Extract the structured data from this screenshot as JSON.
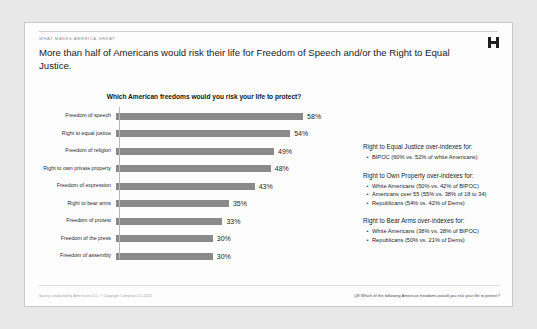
{
  "slide": {
    "eyebrow": "WHAT MAKES AMERICA GREAT",
    "title": "More than half of Americans would risk their life for Freedom of Speech and/or the Right to Equal Justice.",
    "logo_icon": "brand-mark-icon"
  },
  "footer": {
    "source": "Survey conducted by Americans LLC. © Copyright Company LLC 2021",
    "question": "Q8 Which of the following American freedoms would you risk your life to protect?"
  },
  "notes": [
    {
      "heading": "Right to Equal Justice over-indexes for:",
      "items": [
        "BIPOC (60% vs. 52% of white Americans)"
      ]
    },
    {
      "heading": "Right to Own Property over-indexes for:",
      "items": [
        "White Americans (50% vs. 42% of BIPOC)",
        "Americans over 55 (55% vs. 38% of 18 to 34)",
        "Republicans (54% vs. 42% of Dems)"
      ]
    },
    {
      "heading": "Right to Bear Arms over-indexes for:",
      "items": [
        "White Americans (38% vs. 28% of BIPOC)",
        "Republicans (50% vs. 21% of Dems)"
      ]
    }
  ],
  "chart_data": {
    "type": "bar",
    "orientation": "horizontal",
    "title": "Which American freedoms would you risk your life to protect?",
    "xlabel": "",
    "ylabel": "",
    "xlim": [
      0,
      62
    ],
    "grid": false,
    "legend": "none",
    "bar_color": "#8a8a8a",
    "categories": [
      "Freedom of speech",
      "Right to equal justice",
      "Freedom of religion",
      "Right to own private property",
      "Freedom of expression",
      "Right to bear arms",
      "Freedom of protest",
      "Freedom of the press",
      "Freedom of assembly"
    ],
    "values": [
      58,
      54,
      49,
      48,
      43,
      35,
      33,
      30,
      30
    ],
    "value_labels": [
      "58%",
      "54%",
      "49%",
      "48%",
      "43%",
      "35%",
      "33%",
      "30%",
      "30%"
    ]
  }
}
